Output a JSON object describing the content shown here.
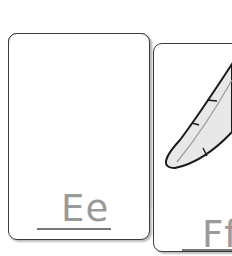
{
  "cards": [
    {
      "id": "card-e",
      "picture": "egg",
      "letter": "Ee"
    },
    {
      "id": "card-f",
      "picture": "feather",
      "letter": "Ff"
    }
  ],
  "colors": {
    "card_border": "#3a3a3a",
    "letter": "#9a9a9a",
    "shadow": "#bdbdbd"
  }
}
